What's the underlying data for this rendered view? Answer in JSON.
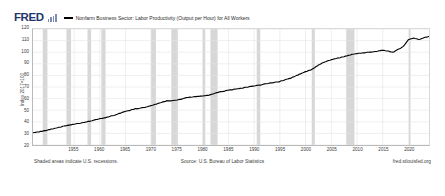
{
  "brand": {
    "logo_text": "FRED",
    "logo_color": "#23366b"
  },
  "legend": {
    "series_label": "Nonfarm Business Sector: Labor Productivity (Output per Hour) for All Workers",
    "series_color": "#000000"
  },
  "footer": {
    "recession_note": "Shaded areas indicate U.S. recessions.",
    "source": "Source: U.S. Bureau of Labor Statistics",
    "url": "fred.stlouisfed.org"
  },
  "chart_data": {
    "type": "line",
    "title": "Nonfarm Business Sector: Labor Productivity (Output per Hour) for All Workers",
    "xlabel": "",
    "ylabel": "Index 2017=100",
    "ylim": [
      20,
      120
    ],
    "xlim": [
      1947,
      2024
    ],
    "grid": true,
    "legend_position": "top",
    "line_color": "#000000",
    "recession_band_color": "#d7d7d7",
    "gridline_color": "#e4e4e4",
    "yticks": [
      120,
      110,
      100,
      90,
      80,
      70,
      60,
      50,
      40,
      30,
      20
    ],
    "xticks": [
      1955,
      1960,
      1965,
      1970,
      1975,
      1980,
      1985,
      1990,
      1995,
      2000,
      2005,
      2010,
      2015,
      2020
    ],
    "series": [
      {
        "name": "Nonfarm Business Sector: Labor Productivity (Output per Hour) for All Workers",
        "x": [
          1947,
          1949,
          1951,
          1953,
          1955,
          1957,
          1959,
          1961,
          1963,
          1965,
          1967,
          1969,
          1971,
          1973,
          1975,
          1977,
          1979,
          1981,
          1983,
          1985,
          1987,
          1989,
          1991,
          1993,
          1995,
          1997,
          1999,
          2001,
          2003,
          2005,
          2007,
          2009,
          2011,
          2013,
          2015,
          2017,
          2019,
          2020,
          2021,
          2022,
          2023,
          2024
        ],
        "values": [
          30.8,
          32.0,
          34.2,
          36.3,
          38.0,
          39.4,
          41.6,
          43.5,
          46.0,
          49.0,
          51.2,
          52.6,
          55.3,
          58.0,
          58.6,
          61.0,
          61.8,
          62.8,
          65.3,
          67.3,
          68.4,
          70.2,
          71.6,
          73.4,
          74.8,
          77.5,
          81.3,
          84.8,
          90.2,
          93.6,
          95.6,
          98.1,
          99.4,
          100.2,
          101.8,
          100.0,
          104.8,
          110.6,
          112.3,
          110.9,
          112.4,
          113.6
        ]
      }
    ],
    "recessions": [
      {
        "start": 1948.9,
        "end": 1949.8
      },
      {
        "start": 1953.5,
        "end": 1954.4
      },
      {
        "start": 1957.6,
        "end": 1958.3
      },
      {
        "start": 1960.3,
        "end": 1961.1
      },
      {
        "start": 1969.9,
        "end": 1970.9
      },
      {
        "start": 1973.9,
        "end": 1975.2
      },
      {
        "start": 1980.0,
        "end": 1980.5
      },
      {
        "start": 1981.5,
        "end": 1982.9
      },
      {
        "start": 1990.5,
        "end": 1991.2
      },
      {
        "start": 2001.2,
        "end": 2001.8
      },
      {
        "start": 2007.9,
        "end": 2009.5
      },
      {
        "start": 2020.1,
        "end": 2020.4
      }
    ]
  }
}
